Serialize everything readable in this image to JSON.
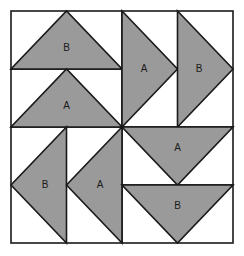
{
  "figure": {
    "canvas": {
      "width": 244,
      "height": 256,
      "background": "#ffffff"
    },
    "style": {
      "triangle_fill": "#9a9a9a",
      "triangle_stroke": "#1a1a1a",
      "triangle_stroke_width": 1.6,
      "grid_stroke": "#3a3a3a",
      "grid_stroke_width": 1.4,
      "outer_border_stroke": "#1a1a1a",
      "outer_border_width": 1.6,
      "label_color": "#1a1a1a",
      "label_font_size": 10
    },
    "outer_square": {
      "x": 11,
      "y": 11,
      "width": 222,
      "height": 232
    },
    "grid": {
      "columns": 4,
      "rows": 4,
      "vertical_lines_x": [
        66.5,
        122,
        177.5
      ],
      "horizontal_lines_y": [
        69,
        127,
        185
      ],
      "center": {
        "x": 122,
        "y": 127
      }
    },
    "quadrants": [
      {
        "name": "top-left",
        "orientation": "up",
        "triangles": [
          {
            "label": "B",
            "points": "11,69 122,69 66.5,11",
            "label_x": 66.5,
            "label_y": 48,
            "direction": "up"
          },
          {
            "label": "A",
            "points": "11,127 122,127 66.5,69",
            "label_x": 66.5,
            "label_y": 106,
            "direction": "up"
          }
        ]
      },
      {
        "name": "top-right",
        "orientation": "right",
        "triangles": [
          {
            "label": "A",
            "points": "122,11 122,127 177.5,69",
            "label_x": 144,
            "label_y": 69,
            "direction": "right"
          },
          {
            "label": "B",
            "points": "177.5,11 177.5,127 233,69",
            "label_x": 199,
            "label_y": 69,
            "direction": "right"
          }
        ]
      },
      {
        "name": "bottom-left",
        "orientation": "left",
        "triangles": [
          {
            "label": "B",
            "points": "66.5,127 66.5,243 11,185",
            "label_x": 45,
            "label_y": 185,
            "direction": "left"
          },
          {
            "label": "A",
            "points": "122,127 122,243 66.5,185",
            "label_x": 100,
            "label_y": 185,
            "direction": "left"
          }
        ]
      },
      {
        "name": "bottom-right",
        "orientation": "down",
        "triangles": [
          {
            "label": "A",
            "points": "122,127 233,127 177.5,185",
            "label_x": 177.5,
            "label_y": 148,
            "direction": "down"
          },
          {
            "label": "B",
            "points": "122,185 233,185 177.5,243",
            "label_x": 177.5,
            "label_y": 206,
            "direction": "down"
          }
        ]
      }
    ],
    "labels_flat": [
      "B",
      "A",
      "A",
      "B",
      "B",
      "A",
      "A",
      "B"
    ]
  }
}
